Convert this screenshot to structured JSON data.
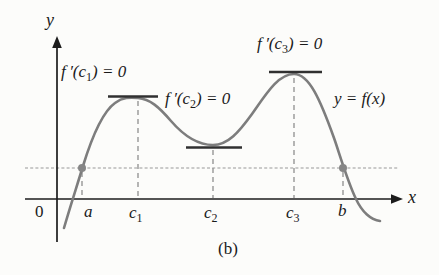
{
  "figure": {
    "caption": "(b)",
    "axis": {
      "y_label": "y",
      "x_label": "x",
      "origin_label": "0"
    },
    "curve_label": "y = f(x)",
    "equations": [
      {
        "pre": "f ′(c",
        "sub": "1",
        "post": ") = 0"
      },
      {
        "pre": "f ′(c",
        "sub": "2",
        "post": ") = 0"
      },
      {
        "pre": "f ′(c",
        "sub": "3",
        "post": ") = 0"
      }
    ],
    "ticks": [
      {
        "pre": "a",
        "sub": ""
      },
      {
        "pre": "c",
        "sub": "1"
      },
      {
        "pre": "c",
        "sub": "2"
      },
      {
        "pre": "c",
        "sub": "3"
      },
      {
        "pre": "b",
        "sub": ""
      }
    ],
    "colors": {
      "curve": "#7d7d7d",
      "tangent": "#303030",
      "axis": "#1c1c1c",
      "dashed": "#8f8f8f",
      "secant_line": "#b9b9b9",
      "dot": "#868686",
      "text": "#1a1a1a"
    }
  }
}
